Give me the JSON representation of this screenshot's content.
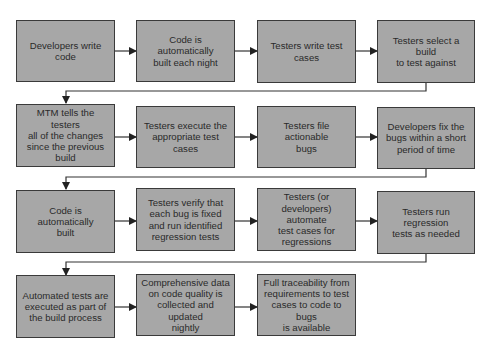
{
  "diagram": {
    "type": "flowchart",
    "colors": {
      "box_fill": "#a7a7a7",
      "box_border": "#3a3a3a",
      "text": "#2a2a2a",
      "connector": "#333333",
      "background": "#ffffff"
    },
    "rows": [
      {
        "steps": [
          {
            "id": "s1",
            "label": "Developers write\ncode"
          },
          {
            "id": "s2",
            "label": "Code is automatically\nbuilt each night"
          },
          {
            "id": "s3",
            "label": "Testers write test\ncases"
          },
          {
            "id": "s4",
            "label": "Testers select a build\nto test against"
          }
        ]
      },
      {
        "steps": [
          {
            "id": "s5",
            "label": "MTM tells the testers\nall of the changes\nsince the previous\nbuild"
          },
          {
            "id": "s6",
            "label": "Testers execute the\nappropriate test cases"
          },
          {
            "id": "s7",
            "label": "Testers file actionable\nbugs"
          },
          {
            "id": "s8",
            "label": "Developers fix the\nbugs within a short\nperiod of time"
          }
        ]
      },
      {
        "steps": [
          {
            "id": "s9",
            "label": "Code is automatically\nbuilt"
          },
          {
            "id": "s10",
            "label": "Testers verify that\neach bug is fixed\nand run identified\nregression tests"
          },
          {
            "id": "s11",
            "label": "Testers  (or\ndevelopers) automate\ntest cases for\nregressions"
          },
          {
            "id": "s12",
            "label": "Testers run regression\ntests as needed"
          }
        ]
      },
      {
        "steps": [
          {
            "id": "s13",
            "label": "Automated tests are\nexecuted as part of\nthe build process"
          },
          {
            "id": "s14",
            "label": "Comprehensive data\non code quality is\ncollected and updated\nnightly"
          },
          {
            "id": "s15",
            "label": "Full traceability from\nrequirements to test\ncases to code to bugs\nis available"
          }
        ]
      }
    ],
    "edges": [
      [
        "s1",
        "s2"
      ],
      [
        "s2",
        "s3"
      ],
      [
        "s3",
        "s4"
      ],
      [
        "s4",
        "s5"
      ],
      [
        "s5",
        "s6"
      ],
      [
        "s6",
        "s7"
      ],
      [
        "s7",
        "s8"
      ],
      [
        "s8",
        "s9"
      ],
      [
        "s9",
        "s10"
      ],
      [
        "s10",
        "s11"
      ],
      [
        "s11",
        "s12"
      ],
      [
        "s12",
        "s13"
      ],
      [
        "s13",
        "s14"
      ],
      [
        "s14",
        "s15"
      ]
    ]
  }
}
